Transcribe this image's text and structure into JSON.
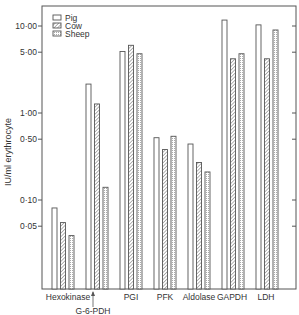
{
  "chart_data": {
    "type": "bar",
    "title": "",
    "xlabel": "",
    "ylabel": "IU/ml erythrocyte",
    "yscale": "log",
    "ylim": [
      0.018,
      14
    ],
    "yticks": [
      10.0,
      5.0,
      1.0,
      0.5,
      0.1,
      0.05
    ],
    "ytick_labels": [
      "10·00",
      "5·00",
      "1·00",
      "0·50",
      "0·10",
      "0·05"
    ],
    "categories": [
      "Hexokinase",
      "G-6-PDH",
      "PGI",
      "PFK",
      "Aldolase",
      "GAPDH",
      "LDH"
    ],
    "series": [
      {
        "name": "Pig",
        "pattern": "open",
        "values": [
          0.081,
          2.15,
          5.1,
          0.52,
          0.44,
          11.7,
          10.3
        ]
      },
      {
        "name": "Cow",
        "pattern": "hatched",
        "values": [
          0.055,
          1.27,
          6.0,
          0.38,
          0.27,
          4.2,
          4.2
        ]
      },
      {
        "name": "Sheep",
        "pattern": "dotted",
        "values": [
          0.039,
          0.14,
          4.8,
          0.54,
          0.21,
          4.8,
          9.0
        ]
      }
    ],
    "legend": {
      "position": "upper-left",
      "entries": [
        "Pig",
        "Cow",
        "Sheep"
      ]
    },
    "grid": false,
    "annotations": [
      {
        "text": "G-6-PDH",
        "arrow_to": "G-6-PDH group",
        "position": "below-axis"
      }
    ]
  },
  "colors": {
    "axis": "#555555",
    "bar_stroke": "#555555",
    "bar_fill": "#ffffff",
    "hatch": "#777777"
  }
}
